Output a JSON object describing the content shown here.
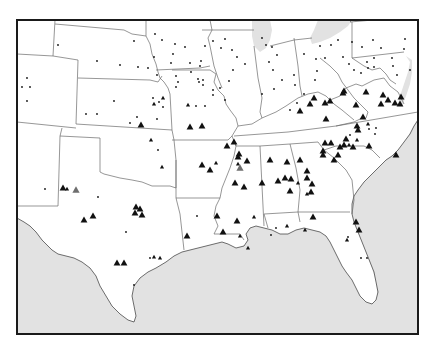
{
  "map": {
    "title": "",
    "region": "Central and Southeastern United States",
    "colors": {
      "land": "#ffffff",
      "water": "#e2e2e2",
      "border": "#6a6a6a",
      "frame": "#1a1a1a",
      "marker": "#111111",
      "marker_highlight": "#6e6e6e"
    },
    "frame": {
      "x": 17,
      "y": 20,
      "width": 401,
      "height": 314
    },
    "large_triangles": [
      [
        190,
        127
      ],
      [
        141,
        125
      ],
      [
        202,
        126
      ],
      [
        210,
        170
      ],
      [
        202,
        165
      ],
      [
        234,
        142
      ],
      [
        217,
        216
      ],
      [
        237,
        221
      ],
      [
        314,
        98
      ],
      [
        330,
        101
      ],
      [
        343,
        93
      ],
      [
        344,
        91
      ],
      [
        366,
        92
      ],
      [
        383,
        95
      ],
      [
        400,
        104
      ],
      [
        388,
        100
      ],
      [
        356,
        105
      ],
      [
        401,
        97
      ],
      [
        326,
        119
      ],
      [
        363,
        117
      ],
      [
        381,
        104
      ],
      [
        395,
        103
      ],
      [
        357,
        126
      ],
      [
        331,
        143
      ],
      [
        344,
        145
      ],
      [
        353,
        147
      ],
      [
        369,
        146
      ],
      [
        358,
        130
      ],
      [
        325,
        143
      ],
      [
        338,
        155
      ],
      [
        334,
        160
      ],
      [
        396,
        155
      ],
      [
        300,
        111
      ],
      [
        310,
        104
      ],
      [
        325,
        103
      ],
      [
        346,
        139
      ],
      [
        340,
        147
      ],
      [
        227,
        146
      ],
      [
        238,
        157
      ],
      [
        239,
        154
      ],
      [
        247,
        161
      ],
      [
        235,
        183
      ],
      [
        244,
        187
      ],
      [
        287,
        162
      ],
      [
        300,
        160
      ],
      [
        285,
        178
      ],
      [
        291,
        179
      ],
      [
        278,
        181
      ],
      [
        262,
        183
      ],
      [
        270,
        160
      ],
      [
        307,
        178
      ],
      [
        312,
        184
      ],
      [
        311,
        192
      ],
      [
        290,
        191
      ],
      [
        313,
        217
      ],
      [
        356,
        222
      ],
      [
        359,
        230
      ],
      [
        223,
        232
      ],
      [
        84,
        220
      ],
      [
        93,
        216
      ],
      [
        63,
        188
      ],
      [
        136,
        207
      ],
      [
        140,
        209
      ],
      [
        135,
        213
      ],
      [
        142,
        215
      ],
      [
        117,
        263
      ],
      [
        124,
        263
      ],
      [
        187,
        236
      ],
      [
        307,
        171
      ],
      [
        323,
        155
      ],
      [
        323,
        151
      ]
    ],
    "small_triangles": [
      [
        154,
        104
      ],
      [
        188,
        105
      ],
      [
        163,
        98
      ],
      [
        151,
        140
      ],
      [
        162,
        167
      ],
      [
        238,
        164
      ],
      [
        349,
        145
      ],
      [
        357,
        140
      ],
      [
        368,
        124
      ],
      [
        216,
        163
      ],
      [
        254,
        217
      ],
      [
        240,
        236
      ],
      [
        248,
        248
      ],
      [
        154,
        257
      ],
      [
        160,
        258
      ],
      [
        67,
        189
      ],
      [
        298,
        183
      ],
      [
        307,
        194
      ],
      [
        287,
        226
      ],
      [
        305,
        230
      ],
      [
        347,
        240
      ]
    ],
    "dots": [
      [
        58,
        45
      ],
      [
        134,
        41
      ],
      [
        155,
        34
      ],
      [
        162,
        40
      ],
      [
        175,
        44
      ],
      [
        185,
        47
      ],
      [
        173,
        54
      ],
      [
        154,
        57
      ],
      [
        171,
        63
      ],
      [
        201,
        61
      ],
      [
        97,
        61
      ],
      [
        120,
        65
      ],
      [
        138,
        67
      ],
      [
        148,
        68
      ],
      [
        157,
        75
      ],
      [
        199,
        82
      ],
      [
        178,
        82
      ],
      [
        176,
        87
      ],
      [
        27,
        78
      ],
      [
        22,
        87
      ],
      [
        30,
        87
      ],
      [
        27,
        101
      ],
      [
        114,
        101
      ],
      [
        153,
        98
      ],
      [
        159,
        102
      ],
      [
        163,
        107
      ],
      [
        137,
        117
      ],
      [
        157,
        119
      ],
      [
        86,
        114
      ],
      [
        97,
        114
      ],
      [
        130,
        123
      ],
      [
        196,
        106
      ],
      [
        205,
        106
      ],
      [
        213,
        90
      ],
      [
        220,
        88
      ],
      [
        229,
        81
      ],
      [
        233,
        70
      ],
      [
        245,
        64
      ],
      [
        237,
        57
      ],
      [
        232,
        50
      ],
      [
        221,
        48
      ],
      [
        213,
        41
      ],
      [
        225,
        39
      ],
      [
        190,
        63
      ],
      [
        200,
        66
      ],
      [
        203,
        80
      ],
      [
        176,
        76
      ],
      [
        191,
        72
      ],
      [
        205,
        46
      ],
      [
        198,
        79
      ],
      [
        203,
        85
      ],
      [
        225,
        100
      ],
      [
        213,
        95
      ],
      [
        262,
        38
      ],
      [
        266,
        45
      ],
      [
        272,
        47
      ],
      [
        277,
        55
      ],
      [
        269,
        62
      ],
      [
        273,
        70
      ],
      [
        282,
        80
      ],
      [
        274,
        89
      ],
      [
        262,
        94
      ],
      [
        294,
        75
      ],
      [
        295,
        85
      ],
      [
        304,
        94
      ],
      [
        297,
        103
      ],
      [
        290,
        110
      ],
      [
        300,
        111
      ],
      [
        304,
        54
      ],
      [
        320,
        46
      ],
      [
        316,
        59
      ],
      [
        317,
        71
      ],
      [
        315,
        80
      ],
      [
        325,
        58
      ],
      [
        331,
        45
      ],
      [
        338,
        40
      ],
      [
        343,
        57
      ],
      [
        349,
        64
      ],
      [
        354,
        70
      ],
      [
        361,
        73
      ],
      [
        368,
        68
      ],
      [
        374,
        58
      ],
      [
        373,
        40
      ],
      [
        352,
        42
      ],
      [
        362,
        47
      ],
      [
        367,
        62
      ],
      [
        374,
        67
      ],
      [
        381,
        48
      ],
      [
        392,
        58
      ],
      [
        404,
        49
      ],
      [
        405,
        39
      ],
      [
        393,
        66
      ],
      [
        397,
        75
      ],
      [
        410,
        70
      ],
      [
        158,
        150
      ],
      [
        197,
        216
      ],
      [
        134,
        285
      ],
      [
        150,
        258
      ],
      [
        45,
        189
      ],
      [
        98,
        197
      ],
      [
        126,
        232
      ],
      [
        276,
        228
      ],
      [
        271,
        235
      ],
      [
        361,
        258
      ],
      [
        367,
        258
      ],
      [
        348,
        237
      ],
      [
        369,
        129
      ],
      [
        375,
        134
      ],
      [
        376,
        128
      ],
      [
        350,
        135
      ]
    ],
    "highlight_triangles": [
      [
        76,
        190
      ],
      [
        240,
        168
      ]
    ]
  }
}
